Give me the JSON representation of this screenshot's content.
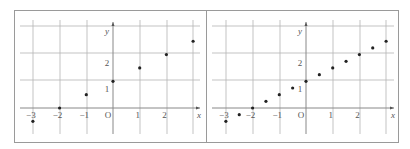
{
  "chart_data": [
    {
      "type": "scatter",
      "title": "",
      "xlabel": "x",
      "ylabel": "y",
      "x": [
        -3,
        -2,
        -1,
        0,
        1,
        2,
        3
      ],
      "y": [
        -0.5,
        0,
        0.5,
        1,
        1.5,
        2,
        2.5
      ],
      "x_ticks": [
        "-3",
        "-2",
        "-1",
        "O",
        "1",
        "2"
      ],
      "y_ticks": [
        "1",
        "2"
      ],
      "xlim": [
        -3,
        3
      ],
      "ylim": [
        -1,
        3
      ],
      "grid": true
    },
    {
      "type": "scatter",
      "title": "",
      "xlabel": "x",
      "ylabel": "y",
      "x": [
        -3,
        -2.5,
        -2,
        -1.5,
        -1,
        -0.5,
        0,
        0.5,
        1,
        1.5,
        2,
        2.5,
        3
      ],
      "y": [
        -0.5,
        -0.25,
        0,
        0.25,
        0.5,
        0.75,
        1,
        1.25,
        1.5,
        1.75,
        2,
        2.25,
        2.5
      ],
      "x_ticks": [
        "-3",
        "-2",
        "-1",
        "O",
        "1",
        "2"
      ],
      "y_ticks": [
        "1",
        "2"
      ],
      "xlim": [
        -3,
        3
      ],
      "ylim": [
        -1,
        3
      ],
      "grid": true
    }
  ],
  "panels": [
    {
      "x_axis_label": "x",
      "y_axis_label": "y",
      "origin_label": "O"
    },
    {
      "x_axis_label": "x",
      "y_axis_label": "y",
      "origin_label": "O"
    }
  ]
}
